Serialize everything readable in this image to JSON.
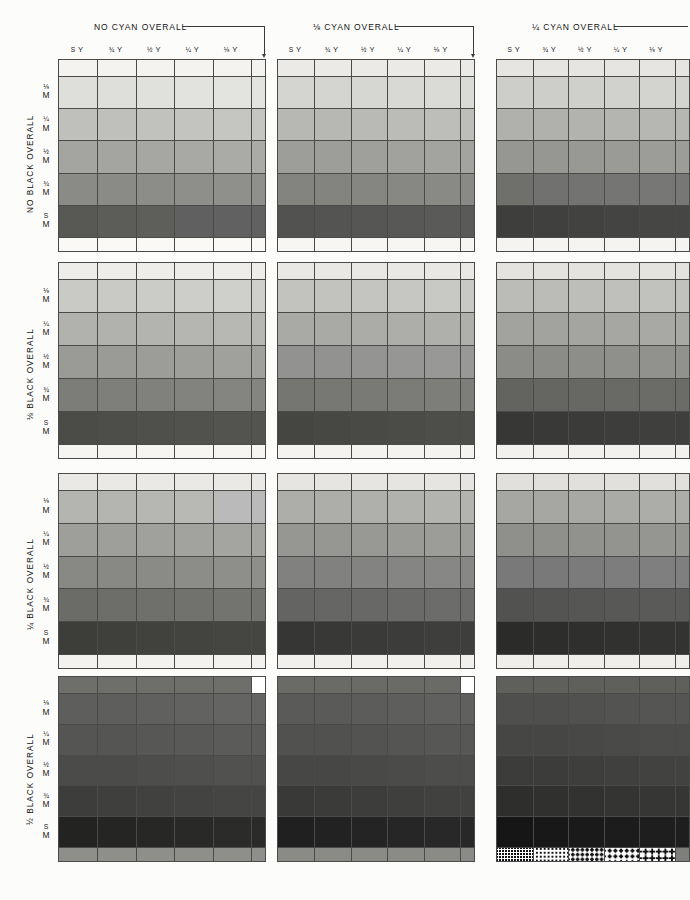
{
  "sheet": {
    "kind": "process-color-guide",
    "width": 690,
    "height": 900,
    "paper": "#fcfcfa",
    "rule_color": "#4a4a4a"
  },
  "column_groups": [
    {
      "id": "cyan-0",
      "label": "NO CYAN OVERALL",
      "cyan": "0"
    },
    {
      "id": "cyan-1-8",
      "label": "⅛ CYAN OVERALL",
      "cyan": "1/8"
    },
    {
      "id": "cyan-1-4",
      "label": "¼ CYAN OVERALL",
      "cyan": "1/4"
    }
  ],
  "column_labels": [
    {
      "fraction": "S",
      "ink": "Y"
    },
    {
      "fraction": "¾",
      "ink": "Y"
    },
    {
      "fraction": "½",
      "ink": "Y"
    },
    {
      "fraction": "¼",
      "ink": "Y"
    },
    {
      "fraction": "⅛",
      "ink": "Y"
    }
  ],
  "row_bands": [
    {
      "id": "black-0",
      "label": "NO BLACK OVERALL",
      "black": "0"
    },
    {
      "id": "black-1-8",
      "label": "⅛ BLACK OVERALL",
      "black": "1/8"
    },
    {
      "id": "black-1-4",
      "label": "¼ BLACK OVERALL",
      "black": "1/4"
    },
    {
      "id": "black-1-2",
      "label": "½ BLACK OVERALL",
      "black": "1/2"
    }
  ],
  "row_labels": [
    {
      "fraction": "⅛",
      "ink": "M"
    },
    {
      "fraction": "¼",
      "ink": "M"
    },
    {
      "fraction": "½",
      "ink": "M"
    },
    {
      "fraction": "¾",
      "ink": "M"
    },
    {
      "fraction": "S",
      "ink": "M"
    }
  ],
  "chart_data": {
    "type": "heatmap",
    "xlabel": "Yellow tint (S Y, ¾ Y, ½ Y, ¼ Y, ⅛ Y)",
    "ylabel": "Magenta tint (⅛ M, ¼ M, ½ M, ¾ M, S M)",
    "grid": true,
    "legend": "none",
    "x": [
      "S Y",
      "¾ Y",
      "½ Y",
      "¼ Y",
      "⅛ Y"
    ],
    "y": [
      "⅛ M",
      "¼ M",
      "½ M",
      "¾ M",
      "S M"
    ],
    "panel_rows": [
      "NO BLACK OVERALL",
      "⅛ BLACK OVERALL",
      "¼ BLACK OVERALL",
      "½ BLACK OVERALL"
    ],
    "panel_cols": [
      "NO CYAN OVERALL",
      "⅛ CYAN OVERALL",
      "¼ CYAN OVERALL"
    ],
    "panels": [
      {
        "id": "k0-c0",
        "black": "0",
        "cyan": "0",
        "top_strip": "#f4f3ef",
        "bottom_strip": "#faf9f5",
        "values": [
          [
            "#dededa",
            "#dededa",
            "#e0e0dc",
            "#e2e2de",
            "#e3e3df"
          ],
          [
            "#bfbfbb",
            "#bfbfbb",
            "#c1c1bd",
            "#c3c3bf",
            "#c5c5c1"
          ],
          [
            "#a4a4a0",
            "#a4a4a0",
            "#a6a6a2",
            "#a8a8a4",
            "#aaaaa6"
          ],
          [
            "#8a8a86",
            "#8a8a86",
            "#8c8c88",
            "#8e8e8a",
            "#8f8f8b"
          ],
          [
            "#585854",
            "#5c5c58",
            "#5e5e5a",
            "#606060",
            "#616161"
          ]
        ]
      },
      {
        "id": "k0-c1",
        "black": "0",
        "cyan": "1/8",
        "top_strip": "#eceae6",
        "bottom_strip": "#f7f6f2",
        "values": [
          [
            "#d4d4d0",
            "#d4d4d0",
            "#d6d6d2",
            "#d8d8d4",
            "#dadad6"
          ],
          [
            "#b7b7b3",
            "#b7b7b3",
            "#b9b9b5",
            "#bbbbb7",
            "#bdbdb9"
          ],
          [
            "#9d9d99",
            "#9d9d99",
            "#9f9f9b",
            "#a1a19d",
            "#a3a39f"
          ],
          [
            "#838380",
            "#838380",
            "#858582",
            "#878784",
            "#898986"
          ],
          [
            "#525250",
            "#545452",
            "#565654",
            "#585856",
            "#5a5a58"
          ]
        ]
      },
      {
        "id": "k0-c2",
        "black": "0",
        "cyan": "1/4",
        "top_strip": "#e7e5e1",
        "bottom_strip": "#f5f4f0",
        "values": [
          [
            "#cdcdc9",
            "#cdcdc9",
            "#cfcfcb",
            "#d1d1cd",
            "#d3d3cf"
          ],
          [
            "#b0b0ac",
            "#b0b0ac",
            "#b2b2ae",
            "#b4b4b0",
            "#b6b6b2"
          ],
          [
            "#969692",
            "#969692",
            "#989894",
            "#9a9a96",
            "#9c9c98"
          ],
          [
            "#6f6f6c",
            "#717170",
            "#737372",
            "#757574",
            "#777776"
          ],
          [
            "#3e3e3c",
            "#40403e",
            "#424240",
            "#444442",
            "#464644"
          ]
        ]
      },
      {
        "id": "k1-c0",
        "black": "1/8",
        "cyan": "0",
        "top_strip": "#eeedea",
        "bottom_strip": "#f6f5f1",
        "values": [
          [
            "#c9c9c5",
            "#c9c9c5",
            "#cbcbc7",
            "#cdcdc9",
            "#cfcfcb"
          ],
          [
            "#b1b1ad",
            "#b1b1ad",
            "#b3b3af",
            "#b5b5b1",
            "#b7b7b3"
          ],
          [
            "#9a9a96",
            "#9a9a96",
            "#9c9c98",
            "#9e9e9a",
            "#a0a09c"
          ],
          [
            "#7c7c78",
            "#7e7e7a",
            "#80807c",
            "#82827e",
            "#848480"
          ],
          [
            "#4b4b48",
            "#4d4d4a",
            "#4f4f4c",
            "#51514e",
            "#535350"
          ]
        ]
      },
      {
        "id": "k1-c1",
        "black": "1/8",
        "cyan": "1/8",
        "top_strip": "#eae8e4",
        "bottom_strip": "#f4f3ef",
        "values": [
          [
            "#c2c2be",
            "#c2c2be",
            "#c4c4c0",
            "#c6c6c2",
            "#c8c8c4"
          ],
          [
            "#a9a9a5",
            "#a9a9a5",
            "#ababa7",
            "#adada9",
            "#afafab"
          ],
          [
            "#929290",
            "#929290",
            "#949492",
            "#969694",
            "#989896"
          ],
          [
            "#757572",
            "#777774",
            "#797976",
            "#7b7b78",
            "#7d7d7a"
          ],
          [
            "#454542",
            "#474744",
            "#494946",
            "#4b4b48",
            "#4d4d4a"
          ]
        ]
      },
      {
        "id": "k1-c2",
        "black": "1/8",
        "cyan": "1/4",
        "top_strip": "#e5e3df",
        "bottom_strip": "#f2f1ed",
        "values": [
          [
            "#bbbbb7",
            "#bbbbb7",
            "#bdbdb9",
            "#bfbfbb",
            "#c1c1bd"
          ],
          [
            "#a2a29e",
            "#a2a29e",
            "#a4a4a0",
            "#a6a6a2",
            "#a8a8a4"
          ],
          [
            "#8b8b88",
            "#8b8b88",
            "#8d8d8a",
            "#8f8f8c",
            "#91918e"
          ],
          [
            "#636360",
            "#656562",
            "#676764",
            "#696966",
            "#6b6b68"
          ],
          [
            "#373735",
            "#393937",
            "#3b3b39",
            "#3d3d3b",
            "#3f3f3d"
          ]
        ]
      },
      {
        "id": "k2-c0",
        "black": "1/4",
        "cyan": "0",
        "top_strip": "#eae9e5",
        "bottom_strip": "#f3f2ee",
        "values": [
          [
            "#b4b4b0",
            "#b4b4b0",
            "#b6b6b2",
            "#b8b8b4",
            "#bababa"
          ],
          [
            "#9e9e9a",
            "#9e9e9a",
            "#a0a09c",
            "#a2a29e",
            "#a4a4a0"
          ],
          [
            "#888884",
            "#888884",
            "#8a8a86",
            "#8c8c88",
            "#8e8e8a"
          ],
          [
            "#6b6b68",
            "#6d6d6a",
            "#6f6f6c",
            "#71716e",
            "#737370"
          ],
          [
            "#3d3d3a",
            "#3f3f3c",
            "#41413e",
            "#434340",
            "#454542"
          ]
        ]
      },
      {
        "id": "k2-c1",
        "black": "1/4",
        "cyan": "1/8",
        "top_strip": "#e7e5e1",
        "bottom_strip": "#f1f0ec",
        "values": [
          [
            "#adada9",
            "#adada9",
            "#afafab",
            "#b1b1ad",
            "#b3b3af"
          ],
          [
            "#969692",
            "#969692",
            "#989894",
            "#9a9a96",
            "#9c9c98"
          ],
          [
            "#818180",
            "#818180",
            "#838382",
            "#858584",
            "#878786"
          ],
          [
            "#646462",
            "#666664",
            "#686866",
            "#6a6a68",
            "#6c6c6a"
          ],
          [
            "#363634",
            "#383836",
            "#3a3a38",
            "#3c3c3a",
            "#3e3e3c"
          ]
        ]
      },
      {
        "id": "k2-c2",
        "black": "1/4",
        "cyan": "1/4",
        "top_strip": "#e2e0dc",
        "bottom_strip": "#efeeea",
        "values": [
          [
            "#a6a6a2",
            "#a6a6a2",
            "#a8a8a4",
            "#aaaaa6",
            "#acaca8"
          ],
          [
            "#8f8f8b",
            "#8f8f8b",
            "#91918d",
            "#93938f",
            "#959591"
          ],
          [
            "#79797a",
            "#79797a",
            "#7b7b7c",
            "#7d7d7e",
            "#7f7f80"
          ],
          [
            "#525250",
            "#545452",
            "#565654",
            "#585856",
            "#5a5a58"
          ],
          [
            "#2b2b29",
            "#2d2d2b",
            "#2f2f2d",
            "#31312f",
            "#333331"
          ]
        ]
      },
      {
        "id": "k3-c0",
        "black": "1/2",
        "cyan": "0",
        "top_strip": "#6e6e6b",
        "bottom_strip": "#8e8e8a",
        "notch": "#ffffff",
        "values": [
          [
            "#5e5e5c",
            "#5e5e5c",
            "#60605e",
            "#626260",
            "#646462"
          ],
          [
            "#555553",
            "#555553",
            "#575755",
            "#595957",
            "#5b5b59"
          ],
          [
            "#4b4b49",
            "#4b4b49",
            "#4d4d4b",
            "#4f4f4d",
            "#51514f"
          ],
          [
            "#3d3d3b",
            "#3f3f3d",
            "#41413f",
            "#434341",
            "#454543"
          ],
          [
            "#232321",
            "#252523",
            "#272725",
            "#292927",
            "#2b2b29"
          ]
        ]
      },
      {
        "id": "k3-c1",
        "black": "1/2",
        "cyan": "1/8",
        "top_strip": "#6a6a67",
        "bottom_strip": "#8a8a86",
        "notch": "#ffffff",
        "values": [
          [
            "#5a5a58",
            "#5a5a58",
            "#5c5c5a",
            "#5e5e5c",
            "#60605e"
          ],
          [
            "#515150",
            "#515150",
            "#535352",
            "#555554",
            "#575756"
          ],
          [
            "#474746",
            "#474746",
            "#494948",
            "#4b4b4a",
            "#4d4d4c"
          ],
          [
            "#393938",
            "#3b3b3a",
            "#3d3d3c",
            "#3f3f3e",
            "#414140"
          ],
          [
            "#202020",
            "#222222",
            "#242424",
            "#262626",
            "#282828"
          ]
        ]
      },
      {
        "id": "k3-c2",
        "black": "1/2",
        "cyan": "1/4",
        "top_strip": "#5f5f5c",
        "bottom_strip": "#7e7e7a",
        "halftone_strip": true,
        "values": [
          [
            "#4f4f4d",
            "#4f4f4d",
            "#51514f",
            "#535351",
            "#555553"
          ],
          [
            "#464645",
            "#464645",
            "#484847",
            "#4a4a49",
            "#4c4c4b"
          ],
          [
            "#3c3c3b",
            "#3c3c3b",
            "#3e3e3d",
            "#40403f",
            "#424241"
          ],
          [
            "#2e2e2d",
            "#30302f",
            "#323231",
            "#343433",
            "#363635"
          ],
          [
            "#161616",
            "#181818",
            "#1a1a1a",
            "#1c1c1c",
            "#1e1e1e"
          ]
        ]
      }
    ]
  }
}
